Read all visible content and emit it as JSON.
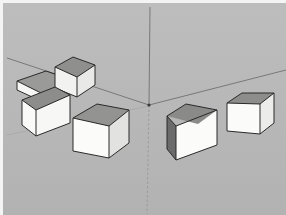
{
  "app": {
    "title": "3D Modeling Viewport",
    "view_mode": "Perspective",
    "background_color": "#b9b9b9",
    "frame_color": "#f4f4f4",
    "render_style": "Shaded"
  },
  "viewport": {
    "width": 286,
    "height": 215,
    "origin_label": "Model Origin",
    "origin": {
      "x": 146,
      "y": 102
    }
  },
  "axes": {
    "line_color": "#6f7270",
    "ground_color": "#9d9f9e",
    "items": [
      {
        "name": "blue-axis-up",
        "label": "Blue Axis (Up)",
        "color": "#6f7270",
        "x1": 147,
        "y1": 4,
        "x2": 146,
        "y2": 102,
        "width": 0.9,
        "dashed": false
      },
      {
        "name": "blue-axis-down",
        "label": "Blue Axis (Down)",
        "color": "#8e908f",
        "x1": 146,
        "y1": 102,
        "x2": 144,
        "y2": 211,
        "width": 0.7,
        "dashed": true
      },
      {
        "name": "green-axis-left",
        "label": "Green Axis (Left)",
        "color": "#6f7270",
        "x1": 4,
        "y1": 55,
        "x2": 146,
        "y2": 102,
        "width": 0.9,
        "dashed": false
      },
      {
        "name": "red-axis-right",
        "label": "Red Axis (Right)",
        "color": "#6f7270",
        "x1": 146,
        "y1": 102,
        "x2": 283,
        "y2": 67,
        "width": 0.9,
        "dashed": false
      },
      {
        "name": "horizon-left",
        "label": "Ground Horizon Left",
        "color": "#a6a8a7",
        "x1": 4,
        "y1": 132,
        "x2": 146,
        "y2": 103,
        "width": 0.8,
        "dashed": false
      }
    ]
  },
  "materials": {
    "face_front": "#f7f7f5",
    "face_front_shadow": "#ededeb",
    "face_top": "#9a9a98",
    "face_top_light": "#a3a3a1",
    "face_side": "#6b6b6b",
    "face_side_dark": "#5e5e5e",
    "edge": "#2a2a2a",
    "edge_width": 1.0
  },
  "objects": {
    "count": 6,
    "group_label": "Boxes",
    "items": [
      {
        "id": "box-1",
        "name": "Flat Box Upper Left",
        "type": "rectangular-prism",
        "selected": false,
        "top": "14,78 43,68 69,77 40,91",
        "front": "14,78 40,91 40,99 14,87",
        "side": "40,91 69,77 69,85 40,99",
        "edges": [
          "14,78 43,68",
          "43,68 69,77",
          "69,77 40,91",
          "40,91 14,78",
          "14,78 14,87",
          "14,87 40,99",
          "40,99 40,91",
          "40,99 69,85",
          "69,85 69,77"
        ]
      },
      {
        "id": "box-2",
        "name": "Small Cube Upper Left",
        "type": "cube",
        "selected": false,
        "top": "52,64 70,54 92,62 74,74",
        "front": "52,64 74,74 74,94 52,85",
        "side": "74,74 92,62 92,82 74,94",
        "edges": [
          "52,64 70,54",
          "70,54 92,62",
          "92,62 74,74",
          "74,74 52,64",
          "52,64 52,85",
          "52,85 74,94",
          "74,94 74,74",
          "74,94 92,82",
          "92,82 92,62"
        ]
      },
      {
        "id": "box-3",
        "name": "Large Cube Left Lower",
        "type": "cube",
        "selected": false,
        "top": "19,97 52,84 67,92 33,107",
        "front": "19,97 33,107 33,133 19,122",
        "side": "33,107 67,92 67,120 33,133",
        "edges": [
          "19,97 52,84",
          "52,84 67,92",
          "67,92 33,107",
          "33,107 19,97",
          "19,97 19,122",
          "19,122 33,133",
          "33,133 33,107",
          "33,133 67,120",
          "67,120 67,92"
        ]
      },
      {
        "id": "box-4",
        "name": "Center Left Cube",
        "type": "cube",
        "selected": false,
        "top": "70,115 94,101 126,107 106,123",
        "front": "70,115 106,123 106,155 70,148",
        "side": "106,123 126,107 126,140 106,155",
        "edges": [
          "70,115 94,101",
          "94,101 126,107",
          "126,107 106,123",
          "106,123 70,115",
          "70,115 70,148",
          "70,148 106,155",
          "106,155 106,123",
          "106,155 126,140",
          "126,140 126,107"
        ]
      },
      {
        "id": "box-5",
        "name": "Center Right Cube",
        "type": "cube",
        "selected": false,
        "top": "164,113 183,101 214,107 195,121",
        "front": "173,123 214,107 214,142 173,157",
        "side": "164,113 173,123 173,157 164,146",
        "edges": [
          "164,113 183,101",
          "183,101 214,107",
          "214,107 173,123",
          "173,123 164,113",
          "164,113 164,146",
          "164,146 173,157",
          "173,157 173,123",
          "173,157 214,142",
          "214,142 214,107"
        ]
      },
      {
        "id": "box-6",
        "name": "Far Right Cube",
        "type": "cube",
        "selected": false,
        "top": "224,100 239,90 271,90 257,101",
        "front": "224,100 257,101 257,131 224,128",
        "side": "257,101 271,90 271,120 257,131",
        "edges": [
          "224,100 239,90",
          "239,90 271,90",
          "271,90 257,101",
          "257,101 224,100",
          "224,100 224,128",
          "224,128 257,131",
          "257,131 257,101",
          "257,131 271,120",
          "271,120 271,90"
        ]
      }
    ]
  }
}
